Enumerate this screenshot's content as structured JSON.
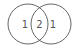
{
  "diagram": {
    "type": "venn",
    "circles": [
      {
        "name": "left",
        "cx": 28,
        "cy": 24,
        "r": 20
      },
      {
        "name": "right",
        "cx": 51,
        "cy": 24,
        "r": 20
      }
    ],
    "regions": {
      "left_only": "1",
      "intersection": "2",
      "right_only": "1"
    },
    "corner_mark": "′",
    "stroke_color": "#555555"
  }
}
